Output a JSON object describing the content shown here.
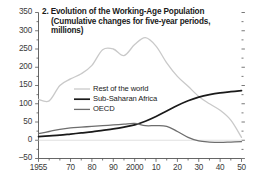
{
  "chart_data": {
    "type": "line",
    "title": "2. Evolution of the Working-Age Population",
    "subtitle_line1": "(Cumulative changes for five-year periods,",
    "subtitle_line2": "millions)",
    "xlabel": "",
    "ylabel": "",
    "ylim": [
      -50,
      350
    ],
    "xlim": [
      1955,
      2050
    ],
    "ytick_step": 50,
    "yminor_step": 25,
    "xtick_step": 5,
    "grid": false,
    "legend_position": "center-left",
    "yticks": [
      -50,
      0,
      50,
      100,
      150,
      200,
      250,
      300,
      350
    ],
    "ytick_labels": [
      "-50",
      "0",
      "50",
      "100",
      "150",
      "200",
      "250",
      "300",
      "350"
    ],
    "x": [
      1955,
      1960,
      1965,
      1970,
      1975,
      1980,
      1985,
      1990,
      1995,
      2000,
      2005,
      2010,
      2015,
      2020,
      2025,
      2030,
      2035,
      2040,
      2045,
      2050
    ],
    "xtick_labels": [
      "1955",
      "",
      "70",
      "",
      "80",
      "",
      "90",
      "",
      "2000",
      "",
      "10",
      "",
      "20",
      "",
      "30",
      "",
      "40",
      "",
      "50",
      ""
    ],
    "xticks_labeled": [
      {
        "year": 1955,
        "label": "1955"
      },
      {
        "year": 1970,
        "label": "70"
      },
      {
        "year": 1980,
        "label": "80"
      },
      {
        "year": 1990,
        "label": "90"
      },
      {
        "year": 2000,
        "label": "2000"
      },
      {
        "year": 2010,
        "label": "10"
      },
      {
        "year": 2020,
        "label": "20"
      },
      {
        "year": 2030,
        "label": "30"
      },
      {
        "year": 2040,
        "label": "40"
      },
      {
        "year": 2050,
        "label": "50"
      }
    ],
    "series": [
      {
        "name": "Rest of the world",
        "color": "#c9c9c9",
        "values": [
          112,
          108,
          150,
          168,
          182,
          205,
          248,
          250,
          232,
          262,
          281,
          258,
          212,
          175,
          148,
          120,
          100,
          82,
          55,
          8
        ]
      },
      {
        "name": "Sub-Saharan Africa",
        "color": "#1a1a1a",
        "values": [
          10,
          12,
          14,
          17,
          20,
          23,
          27,
          31,
          36,
          42,
          52,
          65,
          80,
          95,
          108,
          118,
          125,
          130,
          133,
          136
        ]
      },
      {
        "name": "OECD",
        "color": "#6d6d6d",
        "values": [
          18,
          24,
          30,
          34,
          36,
          38,
          40,
          42,
          44,
          46,
          40,
          40,
          38,
          24,
          8,
          -2,
          -5,
          -6,
          -5,
          -4
        ]
      }
    ]
  }
}
